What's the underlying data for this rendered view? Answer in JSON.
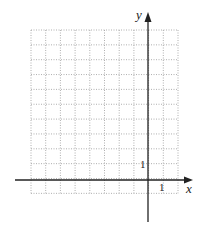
{
  "chart_data": {
    "type": "grid",
    "title": "",
    "xlabel": "x",
    "ylabel": "y",
    "x_tick_labels": [
      "1"
    ],
    "y_tick_labels": [
      "1"
    ],
    "grid": true,
    "grid_style": "dotted",
    "grid_columns": 10,
    "grid_rows": 11,
    "xlim": [
      -8,
      2
    ],
    "ylim": [
      -1,
      10
    ],
    "unit_x": 1,
    "unit_y": 1
  },
  "labels": {
    "x_axis": "x",
    "y_axis": "y",
    "x_tick": "1",
    "y_tick": "1"
  },
  "colors": {
    "grid": "#9a9a9a",
    "axis": "#222222"
  }
}
